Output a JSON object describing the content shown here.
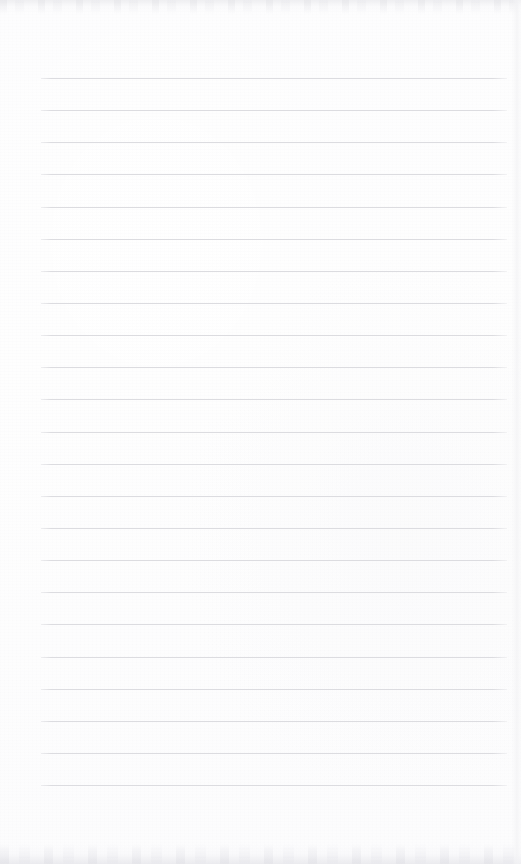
{
  "document": {
    "kind": "lined-notebook-paper-scan",
    "content_text": "",
    "is_blank": true,
    "page_width": 521,
    "page_height": 864,
    "background_color": "#fefefe",
    "rule_color": "#dcdce0",
    "rule_thickness": 1,
    "rule_left": 41,
    "rule_right": 507,
    "rule_width": 466,
    "first_rule_y": 78,
    "rule_spacing": 32.1,
    "rule_count": 23,
    "top_margin": 78,
    "bottom_margin": 79,
    "rules": [
      {
        "index": 1,
        "y": 78
      },
      {
        "index": 2,
        "y": 110
      },
      {
        "index": 3,
        "y": 142
      },
      {
        "index": 4,
        "y": 174
      },
      {
        "index": 5,
        "y": 207
      },
      {
        "index": 6,
        "y": 239
      },
      {
        "index": 7,
        "y": 271
      },
      {
        "index": 8,
        "y": 303
      },
      {
        "index": 9,
        "y": 335
      },
      {
        "index": 10,
        "y": 367
      },
      {
        "index": 11,
        "y": 399
      },
      {
        "index": 12,
        "y": 432
      },
      {
        "index": 13,
        "y": 464
      },
      {
        "index": 14,
        "y": 496
      },
      {
        "index": 15,
        "y": 528
      },
      {
        "index": 16,
        "y": 560
      },
      {
        "index": 17,
        "y": 592
      },
      {
        "index": 18,
        "y": 624
      },
      {
        "index": 19,
        "y": 657
      },
      {
        "index": 20,
        "y": 689
      },
      {
        "index": 21,
        "y": 721
      },
      {
        "index": 22,
        "y": 753
      },
      {
        "index": 23,
        "y": 785
      }
    ],
    "edges": {
      "top_shadow_height": 14,
      "bottom_shadow_height": 20,
      "right_edge_x": 512,
      "right_edge_width": 9,
      "edge_color": "#e8e8ec"
    }
  }
}
